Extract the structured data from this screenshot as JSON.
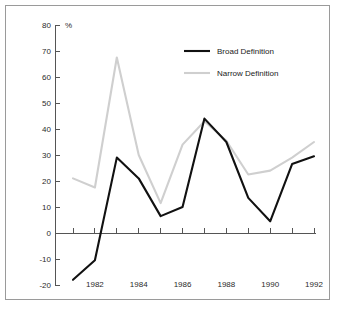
{
  "chart_data": {
    "type": "line",
    "title": "",
    "subtitle": "",
    "xlabel": "",
    "ylabel": "",
    "y_unit": "%",
    "x": [
      1981,
      1982,
      1983,
      1984,
      1985,
      1986,
      1987,
      1988,
      1989,
      1990,
      1991,
      1992
    ],
    "xtick_labels": [
      "1982",
      "1984",
      "1986",
      "1988",
      "1990",
      "1992"
    ],
    "xtick_values": [
      1982,
      1984,
      1986,
      1988,
      1990,
      1992
    ],
    "ytick_labels": [
      "80",
      "70",
      "60",
      "50",
      "40",
      "30",
      "20",
      "10",
      "0",
      "-10",
      "-20"
    ],
    "ytick_values": [
      80,
      70,
      60,
      50,
      40,
      30,
      20,
      10,
      0,
      -10,
      -20
    ],
    "ylim": [
      -20,
      80
    ],
    "xlim": [
      1981,
      1992
    ],
    "grid": false,
    "legend_position": "top-right",
    "series": [
      {
        "name": "Broad Definition",
        "color": "#111111",
        "values": [
          -18.0,
          -10.5,
          29.0,
          21.0,
          6.5,
          10.0,
          44.0,
          35.0,
          13.5,
          4.5,
          26.5,
          29.5
        ]
      },
      {
        "name": "Narrow Definition",
        "color": "#cfcfcf",
        "values": [
          21.0,
          17.5,
          67.5,
          30.0,
          11.5,
          34.0,
          43.0,
          35.5,
          22.5,
          24.0,
          29.0,
          35.0
        ]
      }
    ]
  }
}
